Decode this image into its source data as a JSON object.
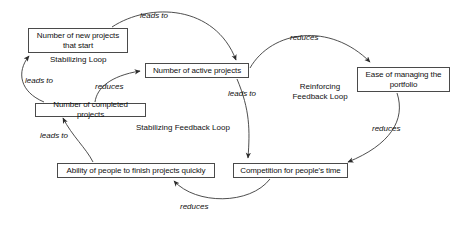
{
  "diagram": {
    "stroke_color": "#4a4a4a",
    "text_color": "#111111",
    "background": "#ffffff",
    "nodes": [
      {
        "id": "new_projects",
        "label": "Number of new projects that start",
        "x": 28,
        "y": 28,
        "w": 100,
        "h": 25
      },
      {
        "id": "active_projects",
        "label": "Number of active projects",
        "x": 145,
        "y": 63,
        "w": 104,
        "h": 15
      },
      {
        "id": "ease_managing",
        "label": "Ease of managing the portfolio",
        "x": 357,
        "y": 67,
        "w": 93,
        "h": 25
      },
      {
        "id": "completed_projects",
        "label": "Number of completed projects",
        "x": 35,
        "y": 103,
        "w": 111,
        "h": 14
      },
      {
        "id": "ability_finish",
        "label": "Ability of people to finish projects quickly",
        "x": 57,
        "y": 163,
        "w": 158,
        "h": 15
      },
      {
        "id": "competition_time",
        "label": "Competition for people's time",
        "x": 233,
        "y": 163,
        "w": 115,
        "h": 15
      }
    ],
    "loop_labels": [
      {
        "id": "stabilizing_loop",
        "text": "Stabilizing Loop",
        "x": 50,
        "y": 55
      },
      {
        "id": "reinforcing_feedback_loop",
        "text": "Reinforcing\nFeedback Loop",
        "x": 285,
        "y": 82
      },
      {
        "id": "stabilizing_feedback_loop",
        "text": "Stabilizing Feedback Loop",
        "x": 136,
        "y": 123
      }
    ],
    "edges": [
      {
        "id": "new-to-active",
        "from": "new_projects",
        "to": "active_projects",
        "label": "leads to",
        "label_x": 140,
        "label_y": 11
      },
      {
        "id": "active-to-ease",
        "from": "active_projects",
        "to": "ease_managing",
        "label": "reduces",
        "label_x": 290,
        "label_y": 33
      },
      {
        "id": "active-to-competition",
        "from": "active_projects",
        "to": "competition_time",
        "label": "leads to",
        "label_x": 228,
        "label_y": 89
      },
      {
        "id": "ease-to-competition",
        "from": "ease_managing",
        "to": "competition_time",
        "label": "reduces",
        "label_x": 372,
        "label_y": 124
      },
      {
        "id": "competition-to-ability",
        "from": "competition_time",
        "to": "ability_finish",
        "label": "reduces",
        "label_x": 180,
        "label_y": 202
      },
      {
        "id": "ability-to-completed",
        "from": "ability_finish",
        "to": "completed_projects",
        "label": "leads to",
        "label_x": 40,
        "label_y": 131
      },
      {
        "id": "completed-to-new",
        "from": "completed_projects",
        "to": "new_projects",
        "label": "leads to",
        "label_x": 25,
        "label_y": 76
      },
      {
        "id": "completed-to-active",
        "from": "completed_projects",
        "to": "active_projects",
        "label": "reduces",
        "label_x": 95,
        "label_y": 82
      }
    ]
  }
}
